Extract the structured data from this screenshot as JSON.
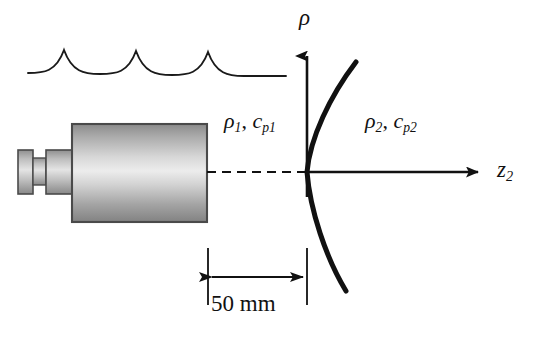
{
  "figure": {
    "background_color": "#ffffff",
    "line_color": "#111111",
    "width": 544,
    "height": 341
  },
  "axes": {
    "vertical": {
      "name": "rho-axis",
      "label": "ρ",
      "origin_x": 307,
      "top_y": 50,
      "bottom_y": 197,
      "arrow": "up"
    },
    "horizontal": {
      "name": "z2-axis",
      "label_symbol": "z",
      "label_subscript": "2",
      "origin_y": 172,
      "start_x": 307,
      "end_x": 484,
      "arrow": "right"
    }
  },
  "labels": {
    "medium_1": {
      "density_symbol": "ρ",
      "density_subscript": "1",
      "separator": ", ",
      "speed_symbol": "c",
      "speed_subscript": "p1"
    },
    "medium_2": {
      "density_symbol": "ρ",
      "density_subscript": "2",
      "separator": ", ",
      "speed_symbol": "c",
      "speed_subscript": "p2"
    }
  },
  "dimension": {
    "text": "50 mm",
    "value": 50,
    "unit": "mm",
    "left_x": 208,
    "right_x": 307,
    "arrow_y": 277,
    "extension_top_y": 248,
    "extension_bottom_y": 305
  },
  "transducer": {
    "name": "ultrasonic-transducer",
    "body": {
      "x": 72,
      "y": 124,
      "width": 135,
      "height": 98
    },
    "collar": {
      "x": 46,
      "y": 150,
      "width": 26,
      "height": 44
    },
    "neck": {
      "x": 33,
      "y": 158,
      "width": 13,
      "height": 27
    },
    "cap": {
      "x": 18,
      "y": 150,
      "width": 15,
      "height": 44
    },
    "gradient_light": "#e8e8e8",
    "gradient_dark": "#8d8d8d",
    "edge_color": "#4a4a4a"
  },
  "beam_axis": {
    "name": "beam-center-axis",
    "style": "dashed",
    "start_x": 207,
    "end_x": 307,
    "y": 172
  },
  "wavefronts": {
    "name": "wavefront-arcs",
    "count": 4,
    "start_x": 28,
    "end_x": 286,
    "baseline_y": 73,
    "cusp_rise": 22
  },
  "interface_curve": {
    "name": "curved-interface",
    "vertex_x": 307,
    "vertex_y": 172,
    "top_x": 356,
    "top_y": 62,
    "bottom_x": 346,
    "bottom_y": 291,
    "stroke_width": 5
  }
}
